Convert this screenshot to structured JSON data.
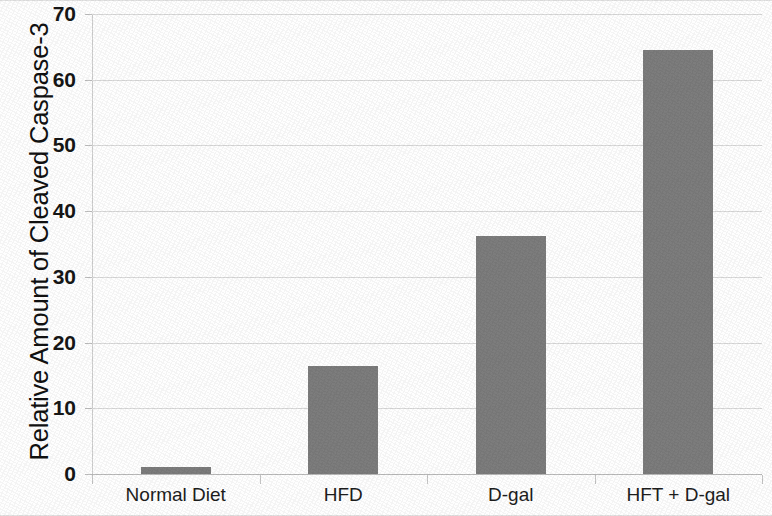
{
  "chart_data": {
    "type": "bar",
    "title": "",
    "xlabel": "",
    "ylabel": "Relative Amount of Cleaved Caspase-3",
    "categories": [
      "Normal Diet",
      "HFD",
      "D-gal",
      "HFT + D-gal"
    ],
    "values": [
      1.1,
      16.5,
      36.2,
      64.5
    ],
    "ylim": [
      0,
      70
    ],
    "ytick_labels": [
      "70",
      "60",
      "50",
      "40",
      "30",
      "20",
      "10",
      "0"
    ],
    "ytick_values": [
      70,
      60,
      50,
      40,
      30,
      20,
      10,
      0
    ],
    "ytick_step": 10,
    "grid": true,
    "grid_axis": "y",
    "legend": null,
    "bar_color": "#7c7c7c",
    "grid_color": "#d9d9d9",
    "axis_color": "#b9b9b9",
    "text_color": "#161616"
  }
}
